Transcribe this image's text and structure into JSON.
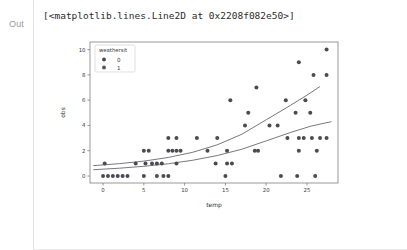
{
  "cell": {
    "prompt_label": "Out",
    "repr_text": "[<matplotlib.lines.Line2D at 0x2208f082e50>]"
  },
  "chart_data": {
    "type": "scatter",
    "title": "",
    "xlabel": "temp",
    "ylabel": "obs",
    "xlim": [
      -1.6,
      28.8
    ],
    "ylim": [
      -0.55,
      10.6
    ],
    "xticks": [
      0,
      5,
      10,
      15,
      20,
      25
    ],
    "yticks": [
      0,
      2,
      4,
      6,
      8,
      10
    ],
    "xticklabels": [
      "0",
      "5",
      "10",
      "15",
      "20",
      "25"
    ],
    "yticklabels": [
      "0",
      "2",
      "4",
      "6",
      "8",
      "10"
    ],
    "grid": false,
    "legend": {
      "title": "weathersit",
      "position": "upper left",
      "entries": [
        {
          "label": "0",
          "color": "#4a4a52",
          "marker": "circle"
        },
        {
          "label": "1",
          "color": "#585860",
          "marker": "circle"
        }
      ]
    },
    "marker_color": "#55555d",
    "marker_size": 2.0,
    "line_color": "#55555d",
    "line_width": 0.8,
    "series": [
      {
        "name": "weathersit=0",
        "marker_color": "#4a4a52",
        "points": [
          [
            0.0,
            0
          ],
          [
            0.6,
            0
          ],
          [
            1.2,
            0
          ],
          [
            1.8,
            0
          ],
          [
            2.4,
            0
          ],
          [
            3.0,
            0
          ],
          [
            5.0,
            0
          ],
          [
            6.6,
            0
          ],
          [
            7.4,
            0
          ],
          [
            8.0,
            0
          ],
          [
            15.0,
            0
          ],
          [
            21.8,
            0
          ],
          [
            23.8,
            0
          ],
          [
            26.0,
            0
          ],
          [
            0.2,
            1
          ],
          [
            4.0,
            1
          ],
          [
            5.2,
            1
          ],
          [
            6.0,
            1
          ],
          [
            6.6,
            1
          ],
          [
            7.2,
            1
          ],
          [
            9.0,
            1
          ],
          [
            13.8,
            1
          ],
          [
            15.2,
            1
          ],
          [
            15.8,
            1
          ],
          [
            5.0,
            2
          ],
          [
            5.6,
            2
          ],
          [
            8.0,
            2
          ],
          [
            8.5,
            2
          ],
          [
            9.0,
            2
          ],
          [
            9.5,
            2
          ],
          [
            12.8,
            2
          ],
          [
            15.2,
            2
          ],
          [
            18.6,
            2
          ],
          [
            19.0,
            2
          ],
          [
            24.0,
            2
          ],
          [
            26.2,
            2
          ],
          [
            8.0,
            3
          ],
          [
            9.0,
            3
          ],
          [
            11.5,
            3
          ],
          [
            14.0,
            3
          ],
          [
            22.6,
            3
          ],
          [
            24.0,
            3
          ],
          [
            24.6,
            3
          ],
          [
            25.6,
            3
          ],
          [
            26.6,
            3
          ],
          [
            27.4,
            3
          ],
          [
            17.4,
            4
          ],
          [
            20.4,
            4
          ],
          [
            21.4,
            4
          ],
          [
            17.8,
            5
          ],
          [
            23.6,
            5
          ],
          [
            25.4,
            5
          ],
          [
            15.6,
            6
          ],
          [
            22.4,
            6
          ],
          [
            24.8,
            6
          ],
          [
            18.8,
            7
          ],
          [
            25.8,
            8
          ],
          [
            27.4,
            8
          ],
          [
            24.0,
            9
          ],
          [
            27.4,
            10
          ]
        ]
      }
    ],
    "fit_lines": [
      {
        "name": "upper-fit",
        "color": "#55555d",
        "description": "exponential fit, upper curve",
        "points": [
          [
            -1.2,
            0.82
          ],
          [
            2.0,
            0.98
          ],
          [
            5.0,
            1.18
          ],
          [
            8.0,
            1.47
          ],
          [
            11.0,
            1.88
          ],
          [
            14.0,
            2.47
          ],
          [
            17.0,
            3.3
          ],
          [
            20.0,
            4.45
          ],
          [
            23.0,
            5.6
          ],
          [
            25.0,
            6.4
          ],
          [
            26.6,
            7.08
          ]
        ]
      },
      {
        "name": "lower-fit",
        "color": "#55555d",
        "description": "exponential fit, lower curve",
        "points": [
          [
            -1.2,
            0.5
          ],
          [
            2.0,
            0.62
          ],
          [
            5.0,
            0.77
          ],
          [
            8.0,
            0.97
          ],
          [
            11.0,
            1.25
          ],
          [
            14.0,
            1.62
          ],
          [
            17.0,
            2.12
          ],
          [
            20.0,
            2.78
          ],
          [
            23.0,
            3.45
          ],
          [
            25.5,
            3.95
          ],
          [
            28.0,
            4.3
          ]
        ]
      }
    ]
  }
}
